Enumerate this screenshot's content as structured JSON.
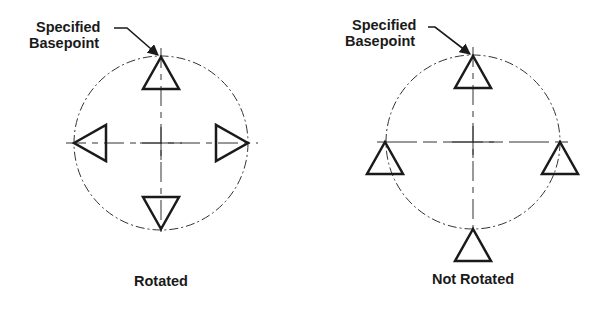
{
  "diagrams": [
    {
      "id": "rotated",
      "caption": "Rotated",
      "label_line1": "Specified",
      "label_line2": "Basepoint",
      "center": [
        161,
        143
      ],
      "radius": 87,
      "markers": [
        {
          "position": "top",
          "orientation": "up",
          "vertex": [
            161,
            57
          ]
        },
        {
          "position": "left",
          "orientation": "left",
          "vertex": [
            74,
            143
          ]
        },
        {
          "position": "right",
          "orientation": "right",
          "vertex": [
            248,
            143
          ]
        },
        {
          "position": "bottom",
          "orientation": "down",
          "vertex": [
            161,
            229
          ]
        }
      ]
    },
    {
      "id": "not-rotated",
      "caption": "Not Rotated",
      "label_line1": "Specified",
      "label_line2": "Basepoint",
      "center": [
        473,
        142
      ],
      "radius": 87,
      "markers": [
        {
          "position": "top",
          "orientation": "up",
          "vertex": [
            473,
            56
          ]
        },
        {
          "position": "left",
          "orientation": "up",
          "vertex": [
            385,
            142
          ]
        },
        {
          "position": "right",
          "orientation": "up",
          "vertex": [
            560,
            142
          ]
        },
        {
          "position": "bottom",
          "orientation": "up",
          "vertex": [
            473,
            229
          ]
        }
      ]
    }
  ],
  "colors": {
    "line": "#1a1a1a",
    "construction": "#333333",
    "background": "#ffffff"
  }
}
